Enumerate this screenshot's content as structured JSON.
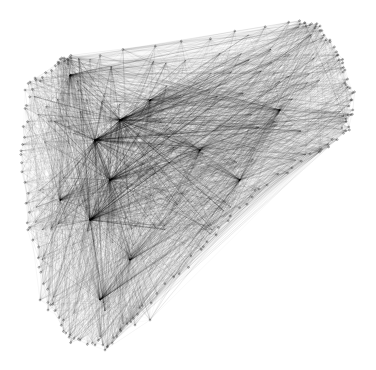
{
  "diagram": {
    "type": "network-graph",
    "background": "#ffffff",
    "edge_color": "#000000",
    "node_color": "#555555",
    "hull": [
      [
        62,
        60
      ],
      [
        70,
        58
      ],
      [
        300,
        22
      ],
      [
        320,
        28
      ],
      [
        340,
        60
      ],
      [
        352,
        95
      ],
      [
        348,
        130
      ],
      [
        320,
        150
      ],
      [
        250,
        195
      ],
      [
        200,
        250
      ],
      [
        140,
        310
      ],
      [
        110,
        345
      ],
      [
        70,
        340
      ],
      [
        50,
        300
      ],
      [
        30,
        230
      ],
      [
        20,
        150
      ],
      [
        30,
        85
      ]
    ],
    "hubs": [
      [
        95,
        140
      ],
      [
        110,
        180
      ],
      [
        120,
        120
      ],
      [
        90,
        220
      ],
      [
        240,
        180
      ],
      [
        280,
        110
      ],
      [
        70,
        75
      ],
      [
        150,
        100
      ],
      [
        130,
        260
      ],
      [
        60,
        200
      ],
      [
        200,
        150
      ],
      [
        100,
        300
      ]
    ],
    "periphery_nodes": {
      "top_left": [
        [
          58,
          62
        ],
        [
          64,
          58
        ],
        [
          68,
          64
        ],
        [
          30,
          82
        ],
        [
          25,
          90
        ],
        [
          35,
          78
        ]
      ],
      "right": [
        [
          300,
          24
        ],
        [
          315,
          28
        ],
        [
          330,
          40
        ],
        [
          338,
          55
        ],
        [
          345,
          70
        ],
        [
          350,
          88
        ],
        [
          352,
          100
        ],
        [
          348,
          115
        ],
        [
          342,
          128
        ]
      ],
      "bottom": [
        [
          40,
          300
        ],
        [
          48,
          310
        ],
        [
          70,
          335
        ],
        [
          80,
          340
        ],
        [
          95,
          345
        ],
        [
          105,
          350
        ],
        [
          120,
          330
        ],
        [
          135,
          325
        ],
        [
          150,
          320
        ]
      ]
    }
  }
}
